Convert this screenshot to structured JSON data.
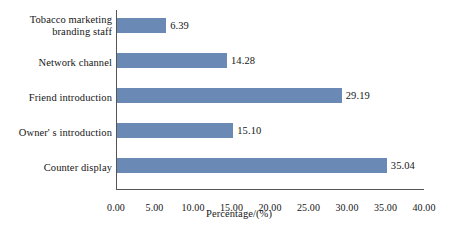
{
  "chart_data": {
    "type": "bar",
    "orientation": "horizontal",
    "title": "",
    "xlabel": "Percentage/(%)",
    "ylabel": "",
    "xlim": [
      0.0,
      40.0
    ],
    "xticks": [
      "0.00",
      "5.00",
      "10.00",
      "15.00",
      "20.00",
      "25.00",
      "30.00",
      "35.00",
      "40.00"
    ],
    "grid": false,
    "legend": false,
    "bar_color": "#6b89b5",
    "axis_color": "#555555",
    "categories": [
      "Tobacco marketing\nbranding staff",
      "Network channel",
      "Friend introduction",
      "Owner' s introduction",
      "Counter display"
    ],
    "values": [
      6.39,
      14.28,
      29.19,
      15.1,
      35.04
    ],
    "value_labels": [
      "6.39",
      "14.28",
      "29.19",
      "15.10",
      "35.04"
    ]
  }
}
